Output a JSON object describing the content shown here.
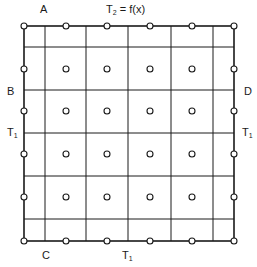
{
  "diagram": {
    "type": "finite-difference grid with boundary conditions",
    "labels": {
      "corner_top_left": "A",
      "corner_left": "B",
      "corner_bottom_left": "C",
      "corner_right": "D",
      "top_boundary_symbol": "T",
      "top_boundary_sub": "2",
      "top_boundary_rest": " = f(x)",
      "left_boundary_symbol": "T",
      "left_boundary_sub": "1",
      "right_boundary_symbol": "T",
      "right_boundary_sub": "1",
      "bottom_boundary_symbol": "T",
      "bottom_boundary_sub": "1"
    },
    "colors": {
      "line": "#1a1a1a",
      "background": "#ffffff"
    },
    "grid": {
      "outer_box": {
        "left": 24,
        "right": 234,
        "top": 26,
        "bottom": 241
      },
      "vertical_lines_x": [
        45,
        86,
        128,
        171,
        213
      ],
      "horizontal_lines_y": [
        47,
        90,
        133,
        176,
        219
      ]
    },
    "nodes": {
      "columns_x": [
        24,
        66,
        107,
        150,
        192,
        234
      ],
      "rows_y": [
        26,
        69,
        111,
        154,
        197,
        241
      ],
      "count": 36,
      "radius": 3
    }
  }
}
